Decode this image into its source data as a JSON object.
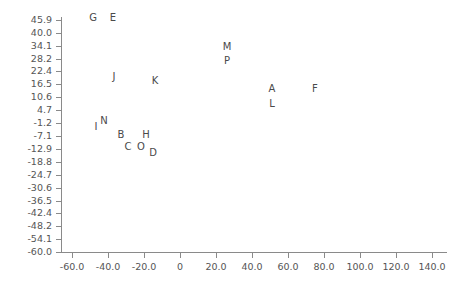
{
  "chart_data": {
    "type": "scatter",
    "title": "",
    "xlabel": "",
    "ylabel": "",
    "xlim": [
      -71.1,
      154.4
    ],
    "ylim": [
      -60.0,
      50.0
    ],
    "grid": false,
    "legend": null,
    "marker_style": "text-label",
    "xticks": [
      "-60.0",
      "-40.0",
      "-20.0",
      "0",
      "20.0",
      "40.0",
      "60.0",
      "80.0",
      "100.0",
      "120.0",
      "140.0"
    ],
    "xtick_values": [
      -60,
      -40,
      -20,
      0,
      20,
      40,
      60,
      80,
      100,
      120,
      140
    ],
    "yticks": [
      "45.9",
      "40.0",
      "34.1",
      "28.2",
      "22.4",
      "16.5",
      "10.6",
      "4.7",
      "-1.2",
      "-7.1",
      "-12.9",
      "-18.8",
      "-24.7",
      "-30.6",
      "-36.5",
      "-42.4",
      "-48.2",
      "-54.1",
      "-60.0"
    ],
    "ytick_values": [
      45.9,
      40.0,
      34.1,
      28.2,
      22.4,
      16.5,
      10.6,
      4.7,
      -1.2,
      -7.1,
      -12.9,
      -18.8,
      -24.7,
      -30.6,
      -36.5,
      -42.4,
      -48.2,
      -54.1,
      -60.0
    ],
    "points": [
      {
        "label": "G",
        "x": -48.3,
        "y": 46.7
      },
      {
        "label": "E",
        "x": -37.2,
        "y": 46.7
      },
      {
        "label": "J",
        "x": -36.7,
        "y": 19.8
      },
      {
        "label": "K",
        "x": -13.9,
        "y": 18.2
      },
      {
        "label": "M",
        "x": 26.1,
        "y": 33.5
      },
      {
        "label": "P",
        "x": 26.1,
        "y": 27.4
      },
      {
        "label": "A",
        "x": 51.1,
        "y": 14.2
      },
      {
        "label": "L",
        "x": 51.1,
        "y": 7.6
      },
      {
        "label": "F",
        "x": 75.0,
        "y": 14.2
      },
      {
        "label": "I",
        "x": -46.7,
        "y": -2.8
      },
      {
        "label": "N",
        "x": -42.2,
        "y": -0.2
      },
      {
        "label": "B",
        "x": -32.8,
        "y": -6.8
      },
      {
        "label": "H",
        "x": -18.9,
        "y": -6.8
      },
      {
        "label": "C",
        "x": -28.9,
        "y": -11.9
      },
      {
        "label": "O",
        "x": -21.7,
        "y": -11.9
      },
      {
        "label": "D",
        "x": -15.0,
        "y": -14.9
      }
    ],
    "colors": {
      "axis": "#8a8a8a",
      "tick_text": "#555555",
      "point_text": "#4a4a4a",
      "background": "#ffffff"
    }
  }
}
